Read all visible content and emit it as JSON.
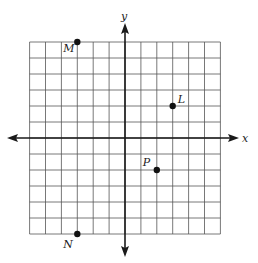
{
  "diagram": {
    "type": "coordinate-plane",
    "grid": {
      "xmin": -6,
      "xmax": 6,
      "ymin": -6,
      "ymax": 6,
      "step": 1
    },
    "axes": {
      "x_label": "x",
      "y_label": "y"
    },
    "points": [
      {
        "name": "M",
        "x": -3,
        "y": 6
      },
      {
        "name": "L",
        "x": 3,
        "y": 2
      },
      {
        "name": "P",
        "x": 2,
        "y": -2
      },
      {
        "name": "N",
        "x": -3,
        "y": -6
      }
    ],
    "colors": {
      "grid": "#555555",
      "axis": "#1a1a1a",
      "point": "#111111"
    }
  }
}
